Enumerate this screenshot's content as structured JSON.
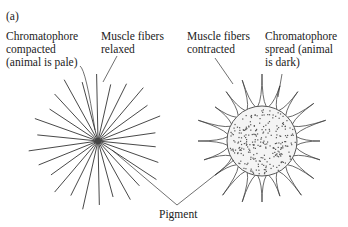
{
  "figure": {
    "panel_label": "(a)",
    "labels": {
      "compacted": "Chromatophore\ncompacted\n(animal is pale)",
      "relaxed": "Muscle fibers\nrelaxed",
      "contracted": "Muscle fibers\ncontracted",
      "spread": "Chromatophore\nspread (animal\nis dark)",
      "pigment": "Pigment"
    },
    "colors": {
      "line": "#333333",
      "dot": "#555555",
      "sphere_fill": "#f2f2f2"
    }
  }
}
